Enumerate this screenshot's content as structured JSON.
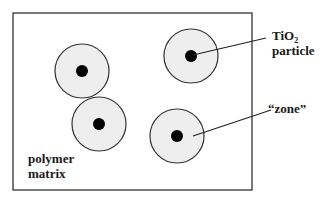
{
  "diagram": {
    "frame": {
      "x": 13,
      "y": 13,
      "width": 239,
      "height": 177,
      "stroke": "#333333"
    },
    "zone_fill": "#eeeeee",
    "zone_stroke": "#333333",
    "particle_fill": "#000000",
    "particles": [
      {
        "cx": 82,
        "cy": 71,
        "zone_r": 27,
        "core_r": 6
      },
      {
        "cx": 99,
        "cy": 124,
        "zone_r": 27,
        "core_r": 6
      },
      {
        "cx": 191,
        "cy": 56,
        "zone_r": 27,
        "core_r": 6
      },
      {
        "cx": 177,
        "cy": 136,
        "zone_r": 27,
        "core_r": 6
      }
    ],
    "labels": {
      "tio2_main": "TiO",
      "tio2_sub": "2",
      "particle": "particle",
      "zone": "“zone”",
      "polymer": "polymer",
      "matrix": "matrix"
    },
    "leaders": [
      {
        "name": "particle-leader",
        "x1": 193,
        "y1": 55,
        "x2": 266,
        "y2": 38
      },
      {
        "name": "zone-leader",
        "x1": 193,
        "y1": 136,
        "x2": 271,
        "y2": 110
      }
    ]
  }
}
